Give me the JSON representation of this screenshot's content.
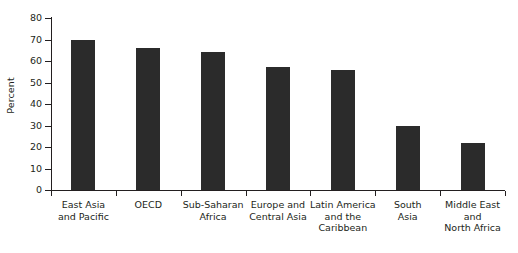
{
  "chart_data": {
    "type": "bar",
    "title": "",
    "xlabel": "",
    "ylabel": "Percent",
    "ylim": [
      0,
      80
    ],
    "yticks": [
      0,
      10,
      20,
      30,
      40,
      50,
      60,
      70,
      80
    ],
    "grid": false,
    "legend": "none",
    "orientation": "vertical",
    "bar_color": "#2b2b2b",
    "axis_color": "#231f20",
    "categories": [
      "East Asia and Pacific",
      "OECD",
      "Sub-Saharan Africa",
      "Europe and Central Asia",
      "Latin America and the Caribbean",
      "South Asia",
      "Middle East and North Africa"
    ],
    "category_lines": [
      [
        "East Asia",
        "and Pacific"
      ],
      [
        "OECD"
      ],
      [
        "Sub-Saharan",
        "Africa"
      ],
      [
        "Europe and",
        "Central Asia"
      ],
      [
        "Latin America",
        "and the",
        "Caribbean"
      ],
      [
        "South",
        "Asia"
      ],
      [
        "Middle East and",
        "North Africa"
      ]
    ],
    "values": [
      70,
      66,
      64,
      57,
      56,
      30,
      22
    ]
  }
}
